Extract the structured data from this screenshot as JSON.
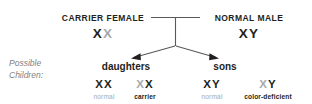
{
  "diagram": {
    "colors": {
      "allele_dark": "#231f20",
      "allele_light": "#a7a9ac",
      "line": "#58595b",
      "caption_gray": "#808285",
      "background": "#ffffff"
    },
    "parents": [
      {
        "label": "CARRIER FEMALE",
        "genotype": "XX",
        "alleles": [
          {
            "symbol": "X",
            "shade": "dark"
          },
          {
            "symbol": "X",
            "shade": "light"
          }
        ]
      },
      {
        "label": "NORMAL MALE",
        "genotype": "XY",
        "alleles": [
          {
            "symbol": "X",
            "shade": "dark"
          },
          {
            "symbol": "Y",
            "shade": "dark"
          }
        ]
      }
    ],
    "caption": {
      "line1": "Possible",
      "line2": "Children:"
    },
    "groups": [
      {
        "heading": "daughters"
      },
      {
        "heading": "sons"
      }
    ],
    "offspring": [
      {
        "genotype": "XX",
        "alleles": [
          {
            "symbol": "X",
            "shade": "dark"
          },
          {
            "symbol": "X",
            "shade": "dark"
          }
        ],
        "phenotype": "normal",
        "phenotype_shade": "light"
      },
      {
        "genotype": "XX",
        "alleles": [
          {
            "symbol": "X",
            "shade": "light"
          },
          {
            "symbol": "X",
            "shade": "dark"
          }
        ],
        "phenotype": "carrier",
        "phenotype_shade": "dark"
      },
      {
        "genotype": "XY",
        "alleles": [
          {
            "symbol": "X",
            "shade": "dark"
          },
          {
            "symbol": "Y",
            "shade": "dark"
          }
        ],
        "phenotype": "normal",
        "phenotype_shade": "light"
      },
      {
        "genotype": "XY",
        "alleles": [
          {
            "symbol": "X",
            "shade": "light"
          },
          {
            "symbol": "Y",
            "shade": "dark"
          }
        ],
        "phenotype": "color-deficient",
        "phenotype_shade": "dark"
      }
    ]
  }
}
